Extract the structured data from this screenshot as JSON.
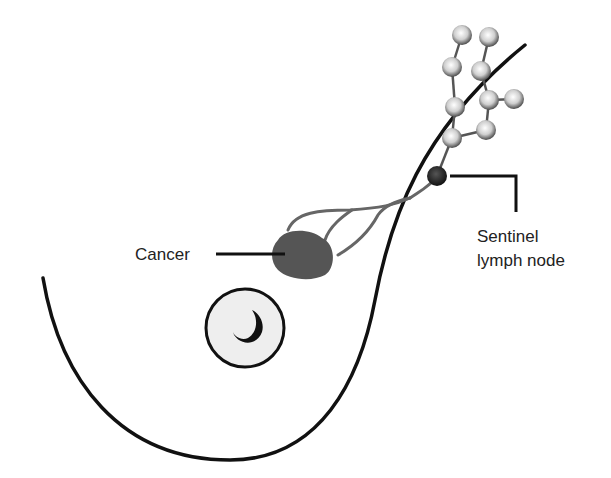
{
  "diagram": {
    "labels": {
      "cancer": "Cancer",
      "sentinel_line1": "Sentinel",
      "sentinel_line2": "lymph node"
    },
    "colors": {
      "outline": "#111111",
      "tumor": "#555555",
      "lymph_vessel": "#666666",
      "sentinel_node": "#222222",
      "lymph_node_fill": "#dddddd",
      "areola_fill": "#eeeeee"
    }
  }
}
